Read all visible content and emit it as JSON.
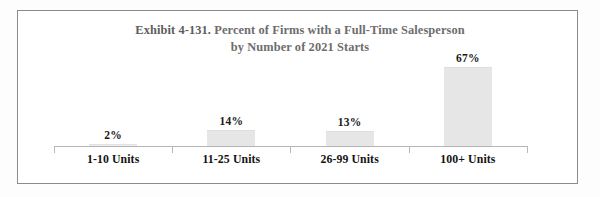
{
  "figure": {
    "title_line1_prefix": "Exhibit 4-131.",
    "title_line1_rest": "Percent of Firms with a Full-Time Salesperson",
    "title_line2": "by Number of 2021 Starts",
    "title_full": "Exhibit 4-131. Percent of Firms with a Full-Time Salesperson by Number of 2021 Starts",
    "border_color": "#8b8b8b",
    "title_color": "#6d6d6d",
    "bar_color": "#e6e6e6",
    "axis_color": "#b4b4b4",
    "label_color": "#1b1b1b"
  },
  "chart_data": {
    "type": "bar",
    "title": "Exhibit 4-131. Percent of Firms with a Full-Time Salesperson by Number of 2021 Starts",
    "xlabel": "",
    "ylabel": "",
    "ylim": [
      0,
      75
    ],
    "grid": false,
    "legend": false,
    "categories": [
      "1-10 Units",
      "11-25 Units",
      "26-99 Units",
      "100+ Units"
    ],
    "values": [
      2,
      14,
      13,
      67
    ],
    "data_labels": [
      "2%",
      "14%",
      "13%",
      "67%"
    ],
    "units": "percent"
  }
}
